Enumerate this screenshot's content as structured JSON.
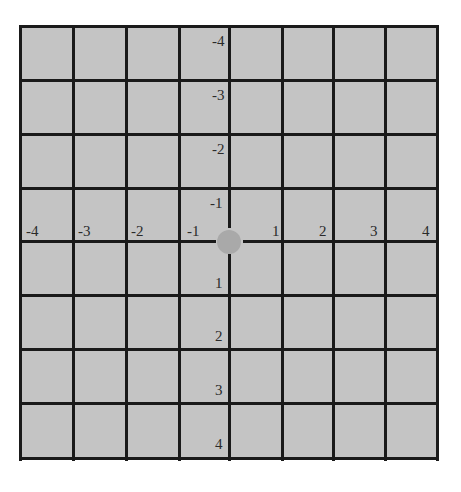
{
  "diagram": {
    "title": "",
    "type": "coordinate-grid",
    "background_color": "#c4c4c4",
    "line_color": "#1a1a1a",
    "dot_color": "#a9a9a9",
    "x_labels": [
      "-4",
      "-3",
      "-2",
      "-1",
      "1",
      "2",
      "3",
      "4"
    ],
    "y_labels_up": [
      "-4",
      "-3",
      "-2",
      "-1"
    ],
    "y_labels_down": [
      "1",
      "2",
      "3",
      "4"
    ],
    "origin_marker": "dot"
  }
}
